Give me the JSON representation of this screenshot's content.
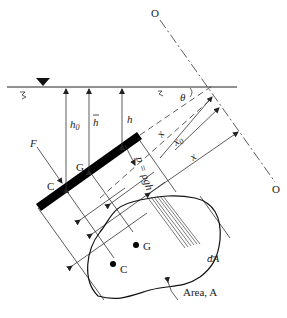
{
  "diagram": {
    "labels": {
      "axis_top": "O",
      "axis_bottom": "O",
      "force": "F",
      "center_pressure_plate": "C",
      "centroid_plate": "G",
      "depth_h0": "h",
      "depth_h0_sub": "0",
      "depth_hbar": "h",
      "depth_h": "h",
      "angle": "θ",
      "pressure": "p = ρgh",
      "dist_xbar": "x",
      "dist_x0": "x",
      "dist_x0_sub": "0",
      "dist_x": "x",
      "centroid_area": "G",
      "center_pressure_area": "C",
      "element": "dA",
      "area": "Area, A"
    },
    "colors": {
      "ink": "#222222",
      "plate": "#000000",
      "background": "#ffffff"
    }
  }
}
